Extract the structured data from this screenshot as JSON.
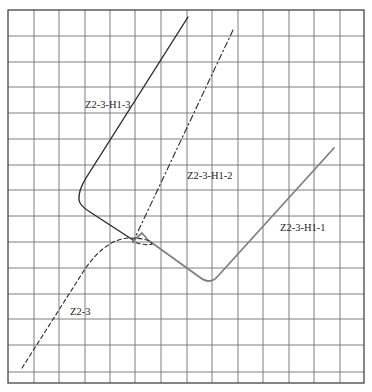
{
  "canvas": {
    "width": 372,
    "height": 392
  },
  "grid": {
    "left": 8,
    "right": 364,
    "top": 10,
    "bottom": 383,
    "vlines": [
      34,
      59,
      85,
      110,
      135,
      161,
      187,
      212,
      238,
      263,
      289,
      314,
      340
    ],
    "hlines": [
      36,
      62,
      87,
      113,
      139,
      165,
      190,
      216,
      242,
      268,
      294,
      319,
      345,
      372
    ],
    "line_color": "#6f6f6f",
    "border_color": "#444444"
  },
  "curves": [
    {
      "id": "Z2-3-H1-3",
      "label": "Z2-3-H1-3",
      "style": "solid",
      "color": "#2a2a2a",
      "width": 1.4,
      "path": "M 188 17 L 86 178 Q 78 191 79 200 Q 80 206 90 212 L 133 240",
      "label_pos": [
        85,
        108
      ]
    },
    {
      "id": "Z2-3-H1-2",
      "label": "Z2-3-H1-2",
      "style": "dashdot",
      "color": "#2a2a2a",
      "width": 1.1,
      "path": "M 233 30 L 133 242",
      "label_pos": [
        187,
        179
      ]
    },
    {
      "id": "Z2-3-H1-1",
      "label": "Z2-3-H1-1",
      "style": "solid",
      "color": "#808080",
      "width": 1.8,
      "path": "M 133 241 L 142 233 L 148 240 L 198 276 Q 210 286 218 276 L 334 148",
      "label_pos": [
        280,
        231
      ]
    },
    {
      "id": "Z2-3",
      "label": "Z2-3",
      "style": "dashed",
      "color": "#2a2a2a",
      "width": 1.1,
      "path": "M 22 368 L 85 269 Q 105 240 128 238 Q 150 238 152 244 Q 148 246 133 242",
      "label_pos": [
        70,
        315
      ]
    }
  ]
}
